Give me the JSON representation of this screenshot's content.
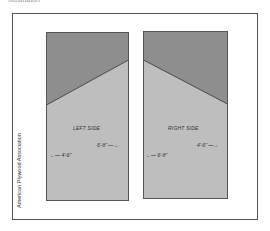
{
  "caption_top": "Illustration",
  "credit": "American Plywood Association",
  "colors": {
    "dark_region": "#8e8e8e",
    "light_region": "#bebebe",
    "panel_border": "#555555",
    "frame_border": "#555555"
  },
  "panels": [
    {
      "label": "LEFT SIDE",
      "dim_left": "←— 4'-6\"",
      "dim_right": "6'-8\" —→"
    },
    {
      "label": "RIGHT SIDE",
      "dim_left": "←— 6'-8\"",
      "dim_right": "4'-6\" —→"
    }
  ]
}
